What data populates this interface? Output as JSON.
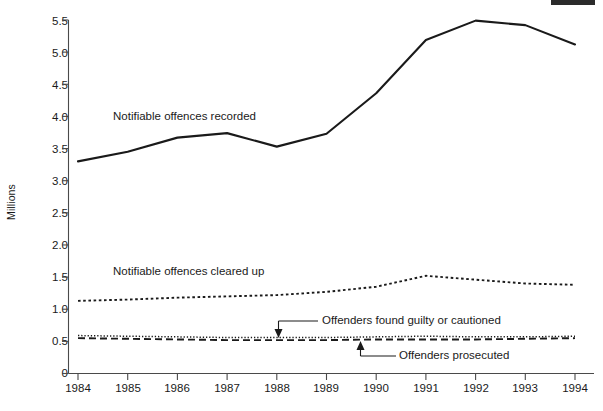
{
  "chart_data": {
    "type": "line",
    "title": "",
    "xlabel": "",
    "ylabel": "Millions",
    "x": [
      1984,
      1985,
      1986,
      1987,
      1988,
      1989,
      1990,
      1991,
      1992,
      1993,
      1994
    ],
    "xtick_labels": [
      "1984",
      "1985",
      "1986",
      "1987",
      "1988",
      "1989",
      "1990",
      "1991",
      "1992",
      "1993",
      "1994"
    ],
    "ytick_labels": [
      "0",
      "0.5",
      "1.0",
      "1.5",
      "2.0",
      "2.5",
      "3.0",
      "3.5",
      "4.0",
      "4.5",
      "5.0",
      "5.5"
    ],
    "ytick_values": [
      0,
      0.5,
      1.0,
      1.5,
      2.0,
      2.5,
      3.0,
      3.5,
      4.0,
      4.5,
      5.0,
      5.5
    ],
    "ylim": [
      0,
      5.5
    ],
    "xlim": [
      1984,
      1994
    ],
    "grid": false,
    "legend_position": "inline-annotations",
    "series": [
      {
        "name": "Notifiable offences recorded",
        "style": "solid",
        "values": [
          3.3,
          3.45,
          3.67,
          3.74,
          3.53,
          3.73,
          4.36,
          5.19,
          5.49,
          5.42,
          5.12
        ]
      },
      {
        "name": "Notifiable offences cleared up",
        "style": "dotted",
        "values": [
          1.13,
          1.15,
          1.18,
          1.2,
          1.22,
          1.27,
          1.35,
          1.52,
          1.46,
          1.4,
          1.38
        ]
      },
      {
        "name": "Offenders found guilty or cautioned",
        "style": "fine-dotted",
        "values": [
          0.59,
          0.58,
          0.57,
          0.56,
          0.56,
          0.56,
          0.57,
          0.58,
          0.57,
          0.57,
          0.58
        ]
      },
      {
        "name": "Offenders prosecuted",
        "style": "dashed",
        "values": [
          0.55,
          0.54,
          0.53,
          0.52,
          0.52,
          0.52,
          0.53,
          0.53,
          0.53,
          0.54,
          0.55
        ]
      }
    ],
    "annotations": [
      {
        "text": "Notifiable offences recorded",
        "target_series": "Notifiable offences recorded",
        "x": 113,
        "y": 117
      },
      {
        "text": "Notifiable offences cleared up",
        "target_series": "Notifiable offences cleared up",
        "x": 113,
        "y": 272
      },
      {
        "text": "Offenders found guilty or cautioned",
        "target_series": "Offenders found guilty or cautioned",
        "x": 322,
        "y": 321,
        "arrow": "down"
      },
      {
        "text": "Offenders prosecuted",
        "target_series": "Offenders prosecuted",
        "x": 399,
        "y": 356,
        "arrow": "up"
      }
    ]
  }
}
